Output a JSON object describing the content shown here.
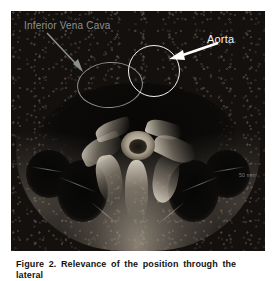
{
  "figure": {
    "name": "axial-mri-abdomen",
    "modality_note": "Axial MRI slice of the abdomen at the level of the great vessels",
    "caption": "Figure 2. Relevance of the position through the lateral",
    "scan": {
      "scale_marker": "50 mm"
    },
    "annotations": [
      {
        "id": "inferior-vena-cava",
        "label": "Inferior Vena Cava",
        "shape": "ellipse",
        "color": "#8b8f8e",
        "arrow_color": "#8b8f8e"
      },
      {
        "id": "aorta",
        "label": "Aorta",
        "shape": "circle",
        "color": "#f2f2f0",
        "arrow_color": "#ffffff"
      }
    ],
    "labels": {
      "ivc": "Inferior Vena Cava",
      "aorta": "Aorta"
    }
  }
}
